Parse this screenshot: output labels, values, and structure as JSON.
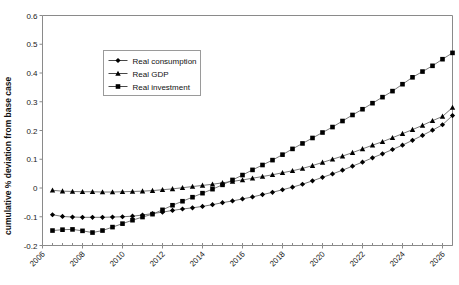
{
  "chart_data": {
    "type": "line",
    "title": "",
    "xlabel": "",
    "ylabel": "cumulative % deviation from base case",
    "ylim": [
      -0.2,
      0.6
    ],
    "ytick_labels": [
      "0.6",
      "0.5",
      "0.4",
      "0.3",
      "0.2",
      "0.1",
      "0",
      "-0.1",
      "-0.2"
    ],
    "ytick_values": [
      0.6,
      0.5,
      0.4,
      0.3,
      0.2,
      0.1,
      0,
      -0.1,
      -0.2
    ],
    "xlim": [
      2006,
      2026.5
    ],
    "xtick_labels": [
      "2006",
      "2008",
      "2010",
      "2012",
      "2014",
      "2016",
      "2018",
      "2020",
      "2022",
      "2024",
      "2026"
    ],
    "xtick_values": [
      2006,
      2008,
      2010,
      2012,
      2014,
      2016,
      2018,
      2020,
      2022,
      2024,
      2026
    ],
    "grid": false,
    "legend_position": "upper-left-inside",
    "x": [
      2006.5,
      2007.0,
      2007.5,
      2008.0,
      2008.5,
      2009.0,
      2009.5,
      2010.0,
      2010.5,
      2011.0,
      2011.5,
      2012.0,
      2012.5,
      2013.0,
      2013.5,
      2014.0,
      2014.5,
      2015.0,
      2015.5,
      2016.0,
      2016.5,
      2017.0,
      2017.5,
      2018.0,
      2018.5,
      2019.0,
      2019.5,
      2020.0,
      2020.5,
      2021.0,
      2021.5,
      2022.0,
      2022.5,
      2023.0,
      2023.5,
      2024.0,
      2024.5,
      2025.0,
      2025.5,
      2026.0,
      2026.5
    ],
    "series": [
      {
        "name": "Real consumption",
        "marker": "diamond",
        "values": [
          -0.093,
          -0.099,
          -0.101,
          -0.102,
          -0.102,
          -0.102,
          -0.101,
          -0.1,
          -0.098,
          -0.094,
          -0.089,
          -0.084,
          -0.078,
          -0.073,
          -0.069,
          -0.064,
          -0.058,
          -0.051,
          -0.045,
          -0.038,
          -0.031,
          -0.023,
          -0.015,
          -0.006,
          0.003,
          0.013,
          0.025,
          0.037,
          0.049,
          0.062,
          0.076,
          0.09,
          0.105,
          0.119,
          0.134,
          0.149,
          0.166,
          0.183,
          0.201,
          0.22,
          0.252
        ]
      },
      {
        "name": "Real GDP",
        "marker": "triangle",
        "values": [
          -0.008,
          -0.011,
          -0.012,
          -0.013,
          -0.013,
          -0.014,
          -0.014,
          -0.013,
          -0.012,
          -0.011,
          -0.009,
          -0.006,
          -0.003,
          0.001,
          0.005,
          0.009,
          0.013,
          0.018,
          0.023,
          0.028,
          0.034,
          0.04,
          0.046,
          0.053,
          0.06,
          0.068,
          0.078,
          0.089,
          0.1,
          0.111,
          0.123,
          0.136,
          0.149,
          0.161,
          0.175,
          0.189,
          0.203,
          0.218,
          0.234,
          0.249,
          0.28
        ]
      },
      {
        "name": "Real investment",
        "marker": "square",
        "values": [
          -0.148,
          -0.145,
          -0.144,
          -0.149,
          -0.155,
          -0.148,
          -0.136,
          -0.124,
          -0.112,
          -0.101,
          -0.091,
          -0.076,
          -0.06,
          -0.046,
          -0.032,
          -0.018,
          -0.004,
          0.011,
          0.028,
          0.045,
          0.063,
          0.08,
          0.097,
          0.116,
          0.136,
          0.155,
          0.174,
          0.193,
          0.212,
          0.233,
          0.254,
          0.274,
          0.295,
          0.316,
          0.337,
          0.361,
          0.385,
          0.405,
          0.425,
          0.448,
          0.47
        ]
      }
    ]
  },
  "legend": {
    "items": [
      {
        "label": "Real consumption",
        "marker": "diamond"
      },
      {
        "label": "Real GDP",
        "marker": "triangle"
      },
      {
        "label": "Real investment",
        "marker": "square"
      }
    ]
  },
  "axes": {
    "y_title": "cumulative % deviation from base case"
  }
}
